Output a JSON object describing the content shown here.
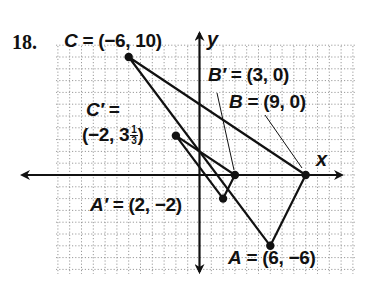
{
  "problem": {
    "number": "18."
  },
  "axes": {
    "x_label": "x",
    "y_label": "y"
  },
  "grid": {
    "x_min": -12,
    "x_max": 13,
    "y_min": -8,
    "y_max": 11,
    "unit_px": 11.8,
    "origin_px": [
      199.5,
      175
    ]
  },
  "points": {
    "C": {
      "name": "C",
      "label": "C = (-6, 10)",
      "x": -6,
      "y": 10
    },
    "B": {
      "name": "B",
      "label": "B = (9, 0)",
      "x": 9,
      "y": 0
    },
    "A": {
      "name": "A",
      "label": "A = (6, -6)",
      "x": 6,
      "y": -6
    },
    "C_prime": {
      "name": "C′",
      "label_line1": "C′ =",
      "label_line2_whole": "(-2, 3",
      "label_frac_num": "1",
      "label_frac_den": "3",
      "label_close": ")",
      "x": -2,
      "y": 3.333
    },
    "B_prime": {
      "name": "B′",
      "label": "B′ = (3, 0)",
      "x": 3,
      "y": 0
    },
    "A_prime": {
      "name": "A′",
      "label": "A′ = (2, -2)",
      "x": 2,
      "y": -2
    }
  },
  "labels": {
    "C": {
      "letter": "C",
      "rest": " = (−6, 10)"
    },
    "B_prime": {
      "letter": "B′",
      "rest": " = (3, 0)"
    },
    "B": {
      "letter": "B",
      "rest": " = (9, 0)"
    },
    "C_prime_1": {
      "letter": "C′",
      "rest": " ="
    },
    "C_prime_2": {
      "text": "(−2, 3",
      "num": "1",
      "den": "3",
      "close": ")"
    },
    "A_prime": {
      "letter": "A′",
      "rest": " = (2, −2)"
    },
    "A": {
      "letter": "A",
      "rest": " = (6, −6)"
    }
  },
  "colors": {
    "ink": "#111111",
    "grid": "#9a9a9a",
    "background": "#ffffff"
  }
}
